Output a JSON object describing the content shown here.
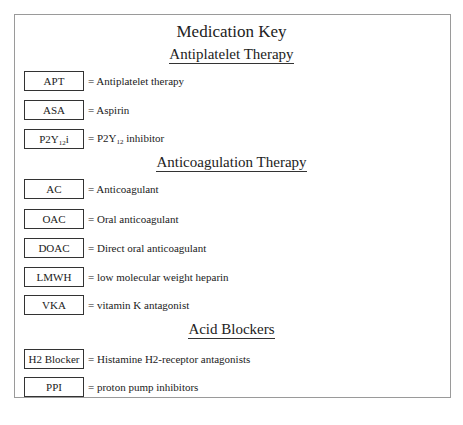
{
  "title": "Medication Key",
  "sections": [
    {
      "heading": "Antiplatelet Therapy",
      "items": [
        {
          "abbr": "APT",
          "definition": "= Antiplatelet therapy"
        },
        {
          "abbr": "ASA",
          "definition": "= Aspirin"
        },
        {
          "abbr_main": "P2Y",
          "abbr_sub": "12",
          "abbr_tail": "i",
          "def_pre": "= P2Y",
          "def_sub": "12",
          "def_tail": " inhibitor"
        }
      ]
    },
    {
      "heading": "Anticoagulation Therapy",
      "items": [
        {
          "abbr": "AC",
          "definition": "= Anticoagulant"
        },
        {
          "abbr": "OAC",
          "definition": "= Oral anticoagulant"
        },
        {
          "abbr": "DOAC",
          "definition": "= Direct oral anticoagulant"
        },
        {
          "abbr": "LMWH",
          "definition": "= low molecular weight heparin"
        },
        {
          "abbr": "VKA",
          "definition": "= vitamin K antagonist"
        }
      ]
    },
    {
      "heading": "Acid Blockers",
      "items": [
        {
          "abbr": "H2 Blocker",
          "definition": "= Histamine H2-receptor antagonists"
        },
        {
          "abbr": "PPI",
          "definition": "= proton pump inhibitors"
        }
      ]
    }
  ]
}
